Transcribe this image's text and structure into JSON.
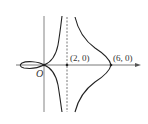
{
  "diagram": {
    "origin_label": "O",
    "points": [
      {
        "label": "(2, 0)",
        "x": 2,
        "y": 0
      },
      {
        "label": "(6, 0)",
        "x": 6,
        "y": 0
      }
    ],
    "asymptote": {
      "type": "vertical",
      "x": 2,
      "style": "dashed"
    },
    "colors": {
      "curve": "#222222",
      "axis": "#555555",
      "background": "#ffffff"
    }
  }
}
